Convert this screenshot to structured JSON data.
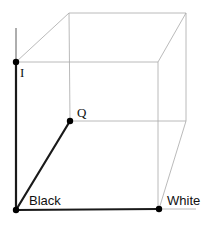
{
  "diagram": {
    "labels": {
      "i_axis": "I",
      "q_axis": "Q",
      "black_vertex": "Black",
      "white_vertex": "White"
    },
    "colors": {
      "cube_edges": "#a8a8a8",
      "axes": "#1a1a1a",
      "points": "#000000"
    },
    "points": {
      "black": [
        16,
        210
      ],
      "white": [
        159,
        209
      ],
      "i": [
        16,
        62
      ],
      "q": [
        70,
        121
      ]
    }
  }
}
